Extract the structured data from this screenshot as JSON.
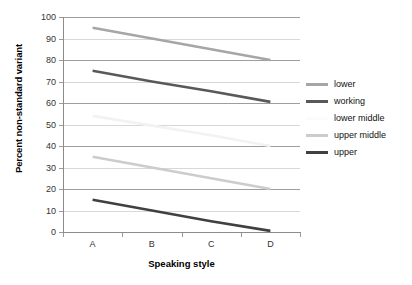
{
  "chart_data": {
    "type": "line",
    "title": "",
    "xlabel": "Speaking style",
    "ylabel": "Percent non-standard variant",
    "categories": [
      "A",
      "B",
      "C",
      "D"
    ],
    "ylim": [
      0,
      100
    ],
    "yticks": [
      0,
      10,
      20,
      30,
      40,
      50,
      60,
      70,
      80,
      90,
      100
    ],
    "grid": true,
    "legend_position": "right",
    "series": [
      {
        "name": "lower",
        "values": [
          95,
          90,
          85,
          80
        ],
        "color": "#a6a6a6"
      },
      {
        "name": "working",
        "values": [
          75,
          70,
          65.5,
          60.5
        ],
        "color": "#595959"
      },
      {
        "name": "lower middle",
        "values": [
          54,
          49.5,
          45,
          40
        ],
        "color": "#f2f2f2"
      },
      {
        "name": "upper middle",
        "values": [
          35,
          30,
          25,
          20
        ],
        "color": "#cccccc"
      },
      {
        "name": "upper",
        "values": [
          15,
          10,
          5,
          0.5
        ],
        "color": "#404040"
      }
    ]
  },
  "axes": {
    "ytick_labels": [
      "100",
      "90",
      "80",
      "70",
      "60",
      "50",
      "40",
      "30",
      "20",
      "10",
      "0"
    ],
    "xtick_labels": [
      "A",
      "B",
      "C",
      "D"
    ],
    "y_axis_title": "Percent non-standard variant",
    "x_axis_title": "Speaking style"
  },
  "legend": {
    "entries": [
      {
        "label": "lower",
        "color": "#a6a6a6"
      },
      {
        "label": "working",
        "color": "#595959"
      },
      {
        "label": "lower middle",
        "color": "#fcfcfc"
      },
      {
        "label": "upper middle",
        "color": "#cccccc"
      },
      {
        "label": "upper",
        "color": "#404040"
      }
    ]
  }
}
